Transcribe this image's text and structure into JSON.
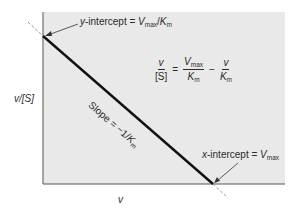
{
  "diagram": {
    "type": "Eadie-Hofstee plot",
    "background_color": "#e9e9e9",
    "line_color": "#111111",
    "extrapolation_color": "#999999",
    "axes": {
      "y_label": "v/[S]",
      "x_label": "v"
    },
    "annotations": {
      "y_intercept": {
        "prefix": "y",
        "text": "-intercept = ",
        "var1": "V",
        "sub1": "max",
        "sep": "/",
        "var2": "K",
        "sub2": "m"
      },
      "x_intercept": {
        "prefix": "x",
        "text": "-intercept = ",
        "var1": "V",
        "sub1": "max"
      },
      "slope": {
        "text": "Slope = −1/",
        "var": "K",
        "sub": "m"
      }
    },
    "equation": {
      "lhs_num": "v",
      "lhs_den": "[S]",
      "equals": "=",
      "t1_num_var": "V",
      "t1_num_sub": "max",
      "t1_den_var": "K",
      "t1_den_sub": "m",
      "minus": "−",
      "t2_num": "v",
      "t2_den_var": "K",
      "t2_den_sub": "m"
    }
  }
}
